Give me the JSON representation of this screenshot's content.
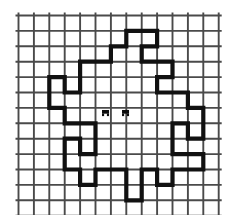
{
  "figure": {
    "kind": "grid-paper-polygon-diagram",
    "title": "",
    "background_color": "#ffffff",
    "grid": {
      "line_color": "#4a4a4a",
      "line_width": 1.9,
      "cell_size": 15.4,
      "origin_x": 18.5,
      "origin_y": 15.5,
      "columns": 13,
      "rows": 13,
      "vertical_line_count": 14,
      "horizontal_line_count": 14
    },
    "polygon": {
      "name": "pinwheel-star-outline",
      "stroke_color": "#111111",
      "stroke_width": 4.2,
      "closed": true,
      "description": "Thick orthogonal closed polygon traced along grid lines forming a four-fold rotationally symmetric pinwheel / star figure",
      "vertices_in_cells": [
        [
          7,
          1
        ],
        [
          9,
          1
        ],
        [
          9,
          2
        ],
        [
          8,
          2
        ],
        [
          8,
          3
        ],
        [
          10,
          3
        ],
        [
          10,
          4
        ],
        [
          9,
          4
        ],
        [
          9,
          5
        ],
        [
          11,
          5
        ],
        [
          11,
          6
        ],
        [
          12,
          6
        ],
        [
          12,
          8
        ],
        [
          11,
          8
        ],
        [
          11,
          7
        ],
        [
          10,
          7
        ],
        [
          10,
          9
        ],
        [
          12,
          9
        ],
        [
          12,
          10
        ],
        [
          10,
          10
        ],
        [
          10,
          11
        ],
        [
          9,
          11
        ],
        [
          9,
          10
        ],
        [
          8,
          10
        ],
        [
          8,
          12
        ],
        [
          7,
          12
        ],
        [
          7,
          10
        ],
        [
          5,
          10
        ],
        [
          5,
          11
        ],
        [
          4,
          11
        ],
        [
          4,
          10
        ],
        [
          3,
          10
        ],
        [
          3,
          8
        ],
        [
          4,
          8
        ],
        [
          4,
          9
        ],
        [
          5,
          9
        ],
        [
          5,
          7
        ],
        [
          3,
          7
        ],
        [
          3,
          6
        ],
        [
          2,
          6
        ],
        [
          2,
          4
        ],
        [
          3,
          4
        ],
        [
          3,
          5
        ],
        [
          4,
          5
        ],
        [
          4,
          3
        ],
        [
          6,
          3
        ],
        [
          6,
          2
        ],
        [
          7,
          2
        ]
      ]
    },
    "center_marks": [
      {
        "name": "center-mark-left",
        "glyph": "small-dark-blob",
        "cell_x": 5.65,
        "cell_y": 6.33,
        "width": 7,
        "height": 6,
        "color": "#0c0c0c"
      },
      {
        "name": "center-mark-right",
        "glyph": "small-dark-blob",
        "cell_x": 6.95,
        "cell_y": 6.33,
        "width": 7,
        "height": 6,
        "color": "#0c0c0c"
      }
    ]
  }
}
